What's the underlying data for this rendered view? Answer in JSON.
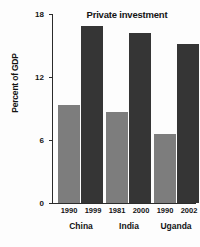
{
  "chart_data": {
    "type": "bar",
    "title": "Private investment",
    "xlabel": "",
    "ylabel": "Percent of GDP",
    "ylim": [
      0,
      18
    ],
    "yticks": [
      0,
      6,
      12,
      18
    ],
    "ytick_labels": [
      "0",
      "6",
      "12",
      "18"
    ],
    "grid": false,
    "legend": "none",
    "categories": [
      "China",
      "India",
      "Uganda"
    ],
    "series": [
      {
        "name": "earlier year",
        "color": "#7d7d7d",
        "period_labels": [
          "1990",
          "1981",
          "1990"
        ],
        "values": [
          9.3,
          8.7,
          6.6
        ]
      },
      {
        "name": "later year",
        "color": "#353535",
        "period_labels": [
          "1999",
          "2000",
          "2002"
        ],
        "values": [
          16.9,
          16.2,
          15.1
        ]
      }
    ],
    "bars": [
      {
        "country": "China",
        "year": "1990",
        "value": 9.3,
        "shade": "light"
      },
      {
        "country": "China",
        "year": "1999",
        "value": 16.9,
        "shade": "dark"
      },
      {
        "country": "India",
        "year": "1981",
        "value": 8.7,
        "shade": "light"
      },
      {
        "country": "India",
        "year": "2000",
        "value": 16.2,
        "shade": "dark"
      },
      {
        "country": "Uganda",
        "year": "1990",
        "value": 6.6,
        "shade": "light"
      },
      {
        "country": "Uganda",
        "year": "2002",
        "value": 15.1,
        "shade": "dark"
      }
    ]
  },
  "axis": {
    "tick_0": "0",
    "tick_1": "6",
    "tick_2": "12",
    "tick_3": "18"
  },
  "labels": {
    "china_years_left": "1990",
    "china_years_right": "1999",
    "india_years_left": "1981",
    "india_years_right": "2000",
    "uganda_years_left": "1990",
    "uganda_years_right": "2002",
    "china": "China",
    "india": "India",
    "uganda": "Uganda"
  },
  "colors": {
    "light_bar": "#7d7d7d",
    "dark_bar": "#353535",
    "axis": "#2b2b2b",
    "background": "#fdfdfd",
    "text": "#141414"
  }
}
